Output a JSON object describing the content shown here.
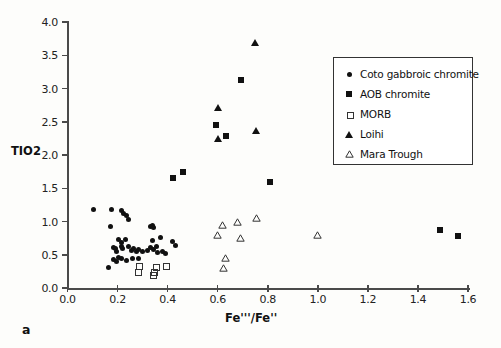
{
  "figure": {
    "panel_label": "a",
    "background": "#fdfdfb",
    "axis_color": "#4a4a4a",
    "marker_color": "#111111"
  },
  "chart_data": {
    "type": "scatter",
    "title": "",
    "xlabel": "Fe'''/Fe''",
    "ylabel": "TIO2",
    "xlim": [
      0.0,
      1.6
    ],
    "ylim": [
      0.0,
      4.0
    ],
    "xticks": [
      "0.0",
      "0.2",
      "0.4",
      "0.6",
      "0.8",
      "1.0",
      "1.2",
      "1.4",
      "1.6"
    ],
    "xtick_values": [
      0.0,
      0.2,
      0.4,
      0.6,
      0.8,
      1.0,
      1.2,
      1.4,
      1.6
    ],
    "yticks": [
      "0.0",
      "0.5",
      "1.0",
      "1.5",
      "2.0",
      "2.5",
      "3.0",
      "3.5",
      "4.0"
    ],
    "ytick_values": [
      0.0,
      0.5,
      1.0,
      1.5,
      2.0,
      2.5,
      3.0,
      3.5,
      4.0
    ],
    "grid": false,
    "legend_position": "upper-right",
    "series": [
      {
        "name": "Coto gabbroic chromite",
        "marker": "filled-circle",
        "points": [
          [
            0.105,
            1.185
          ],
          [
            0.175,
            1.185
          ],
          [
            0.215,
            1.165
          ],
          [
            0.225,
            1.125
          ],
          [
            0.235,
            1.085
          ],
          [
            0.245,
            1.03
          ],
          [
            0.17,
            0.93
          ],
          [
            0.33,
            0.93
          ],
          [
            0.34,
            0.945
          ],
          [
            0.345,
            0.905
          ],
          [
            0.185,
            0.615
          ],
          [
            0.19,
            0.6
          ],
          [
            0.195,
            0.555
          ],
          [
            0.205,
            0.73
          ],
          [
            0.215,
            0.69
          ],
          [
            0.215,
            0.63
          ],
          [
            0.22,
            0.59
          ],
          [
            0.23,
            0.735
          ],
          [
            0.245,
            0.62
          ],
          [
            0.255,
            0.56
          ],
          [
            0.265,
            0.6
          ],
          [
            0.275,
            0.545
          ],
          [
            0.285,
            0.58
          ],
          [
            0.3,
            0.545
          ],
          [
            0.32,
            0.56
          ],
          [
            0.33,
            0.61
          ],
          [
            0.34,
            0.71
          ],
          [
            0.345,
            0.575
          ],
          [
            0.355,
            0.62
          ],
          [
            0.36,
            0.53
          ],
          [
            0.37,
            0.76
          ],
          [
            0.38,
            0.545
          ],
          [
            0.39,
            0.525
          ],
          [
            0.42,
            0.695
          ],
          [
            0.43,
            0.645
          ],
          [
            0.165,
            0.31
          ],
          [
            0.185,
            0.43
          ],
          [
            0.195,
            0.405
          ],
          [
            0.205,
            0.455
          ],
          [
            0.215,
            0.44
          ],
          [
            0.235,
            0.415
          ],
          [
            0.26,
            0.44
          ],
          [
            0.285,
            0.45
          ]
        ]
      },
      {
        "name": "AOB chromite",
        "marker": "filled-square",
        "points": [
          [
            0.42,
            1.65
          ],
          [
            0.46,
            1.74
          ],
          [
            0.595,
            2.45
          ],
          [
            0.635,
            2.29
          ],
          [
            0.695,
            3.13
          ],
          [
            0.81,
            1.595
          ],
          [
            1.49,
            0.865
          ],
          [
            1.56,
            0.775
          ]
        ]
      },
      {
        "name": "MORB",
        "marker": "open-square",
        "points": [
          [
            0.28,
            0.255
          ],
          [
            0.285,
            0.345
          ],
          [
            0.34,
            0.2
          ],
          [
            0.345,
            0.25
          ],
          [
            0.35,
            0.33
          ],
          [
            0.39,
            0.345
          ]
        ]
      },
      {
        "name": "Loihi",
        "marker": "filled-triangle",
        "points": [
          [
            0.6,
            2.72
          ],
          [
            0.6,
            2.255
          ],
          [
            0.75,
            3.69
          ],
          [
            0.755,
            2.37
          ]
        ]
      },
      {
        "name": "Mara Trough",
        "marker": "open-triangle",
        "points": [
          [
            0.6,
            0.79
          ],
          [
            0.62,
            0.945
          ],
          [
            0.625,
            0.3
          ],
          [
            0.63,
            0.455
          ],
          [
            0.68,
            1.0
          ],
          [
            0.69,
            0.745
          ],
          [
            0.755,
            1.05
          ],
          [
            1.0,
            0.8
          ]
        ]
      }
    ]
  },
  "legend": {
    "entries": [
      {
        "label": "Coto gabbroic chromite",
        "marker": "filled-circle"
      },
      {
        "label": "AOB chromite",
        "marker": "filled-square"
      },
      {
        "label": "MORB",
        "marker": "open-square"
      },
      {
        "label": "Loihi",
        "marker": "filled-triangle"
      },
      {
        "label": "Mara Trough",
        "marker": "open-triangle"
      }
    ]
  }
}
